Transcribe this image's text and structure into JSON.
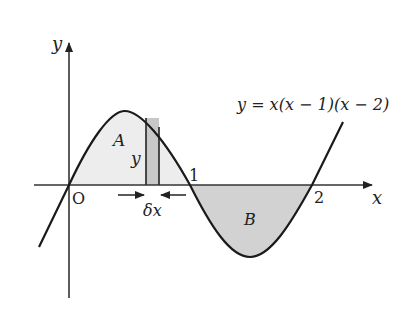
{
  "diagram": {
    "equation": "y = x(x − 1)(x − 2)",
    "axis_labels": {
      "x": "x",
      "y": "y"
    },
    "origin_label": "O",
    "tick_labels": [
      "1",
      "2"
    ],
    "regions": [
      {
        "name": "A",
        "fill": "#ededed"
      },
      {
        "name": "B",
        "fill": "#d0d0d0"
      }
    ],
    "strip": {
      "height_label": "y",
      "width_label": "δx",
      "fill": "#c8c8c8"
    },
    "colors": {
      "curve": "#1a1a1a",
      "axis": "#333333"
    }
  }
}
